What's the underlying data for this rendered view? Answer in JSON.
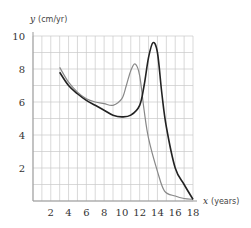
{
  "chart_data": {
    "type": "line",
    "title": "",
    "xlabel": "x (years)",
    "ylabel": "y (cm/yr)",
    "xlabel_var": "x",
    "xlabel_unit": "(years)",
    "ylabel_var": "y",
    "ylabel_unit": "(cm/yr)",
    "xlim": [
      0,
      18
    ],
    "ylim": [
      0,
      10
    ],
    "xticks": [
      2,
      4,
      6,
      8,
      10,
      12,
      14,
      16,
      18
    ],
    "yticks": [
      2,
      4,
      6,
      8,
      10
    ],
    "grid": true,
    "grid_step_x": 1,
    "grid_step_y": 1,
    "legend": null,
    "series": [
      {
        "name": "dark curve",
        "color": "#222222",
        "x": [
          3,
          4,
          5,
          6,
          7,
          8,
          9,
          10,
          11,
          12,
          12.5,
          13,
          13.5,
          14,
          14.5,
          15,
          16,
          17,
          18
        ],
        "y": [
          7.8,
          7.0,
          6.5,
          6.1,
          5.8,
          5.5,
          5.2,
          5.1,
          5.2,
          5.8,
          7.0,
          8.7,
          9.6,
          9.0,
          6.5,
          4.5,
          2.0,
          1.0,
          0.1
        ]
      },
      {
        "name": "gray curve",
        "color": "#888888",
        "x": [
          3,
          4,
          5,
          6,
          7,
          8,
          9,
          10,
          10.5,
          11,
          11.5,
          12,
          12.5,
          13,
          14,
          14.8,
          16,
          17,
          18
        ],
        "y": [
          8.1,
          7.2,
          6.6,
          6.2,
          6.0,
          5.9,
          5.8,
          6.2,
          7.0,
          7.9,
          8.3,
          7.6,
          5.5,
          3.8,
          1.8,
          0.6,
          0.3,
          0.15,
          0.1
        ]
      }
    ]
  }
}
